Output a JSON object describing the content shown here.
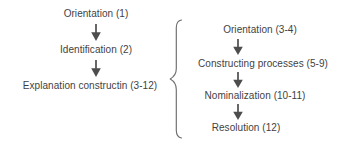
{
  "diagram": {
    "background_color": "#ffffff",
    "text_color": "#3f3f3f",
    "arrow_color": "#4d4d4d",
    "brace_color": "#6e6e6e",
    "left_flow": {
      "name": "Overall stage sequence",
      "nodes": [
        {
          "label": "Orientation (1)",
          "stage": "Orientation",
          "clause_range": "1"
        },
        {
          "label": "Identification (2)",
          "stage": "Identification",
          "clause_range": "2"
        },
        {
          "label": "Explanation constructin (3-12)",
          "stage": "Explanation constructin",
          "clause_range": "3-12"
        }
      ],
      "connectors": [
        "down-arrow",
        "down-arrow"
      ]
    },
    "right_flow": {
      "name": "Explanation construction phases",
      "nodes": [
        {
          "label": "Orientation (3-4)",
          "stage": "Orientation",
          "clause_range": "3-4"
        },
        {
          "label": "Constructing processes (5-9)",
          "stage": "Constructing processes",
          "clause_range": "5-9"
        },
        {
          "label": "Nominalization (10-11)",
          "stage": "Nominalization",
          "clause_range": "10-11"
        },
        {
          "label": "Resolution (12)",
          "stage": "Resolution",
          "clause_range": "12"
        }
      ],
      "connectors": [
        "down-arrow",
        "down-arrow",
        "down-arrow"
      ]
    },
    "brace": {
      "glyph": "{",
      "orientation": "left-facing-open-right",
      "expands_from": "Explanation constructin (3-12)"
    }
  }
}
